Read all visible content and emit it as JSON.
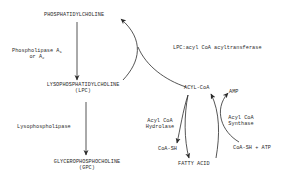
{
  "diagram": {
    "nodes": {
      "phosphatidylcholine": "PHOSPHATIDYLCHOLINE",
      "lpc_line1": "LYSOPHOSPHATIDYLCHOLINE",
      "lpc_line2": "(LPC)",
      "gpc_line1": "GLYCEROPHOSPHOCHOLINE",
      "gpc_line2": "(GPC)",
      "acyl_coa": "ACYL-CoA",
      "amp": "AMP",
      "coa_sh": "CoA-SH",
      "coa_sh_atp": "CoA-SH + ATP",
      "fatty_acid": "FATTY ACID"
    },
    "enzymes": {
      "phospholipase_line1": "Phospholipase A",
      "phospholipase_sub1": "1",
      "phospholipase_line2": "or A",
      "phospholipase_sub2": "2",
      "lysophospholipase": "Lysophospholipase",
      "lpc_acyltransferase": "LPC:acyl CoA acyltransferase",
      "hydrolase_line1": "Acyl CoA",
      "hydrolase_line2": "Hydrolase",
      "synthase_line1": "Acyl CoA",
      "synthase_line2": "Synthase"
    },
    "edges": [
      {
        "from": "PHOSPHATIDYLCHOLINE",
        "to": "LYSOPHOSPHATIDYLCHOLINE",
        "label": "Phospholipase A1 or A2"
      },
      {
        "from": "LYSOPHOSPHATIDYLCHOLINE",
        "to": "GLYCEROPHOSPHOCHOLINE",
        "label": "Lysophospholipase"
      },
      {
        "from": "LYSOPHOSPHATIDYLCHOLINE + ACYL-CoA",
        "to": "PHOSPHATIDYLCHOLINE",
        "label": "LPC:acyl CoA acyltransferase"
      },
      {
        "from": "ACYL-CoA",
        "to": "FATTY ACID + CoA-SH",
        "label": "Acyl CoA Hydrolase"
      },
      {
        "from": "FATTY ACID + CoA-SH + ATP",
        "to": "ACYL-CoA + AMP",
        "label": "Acyl CoA Synthase"
      }
    ]
  }
}
